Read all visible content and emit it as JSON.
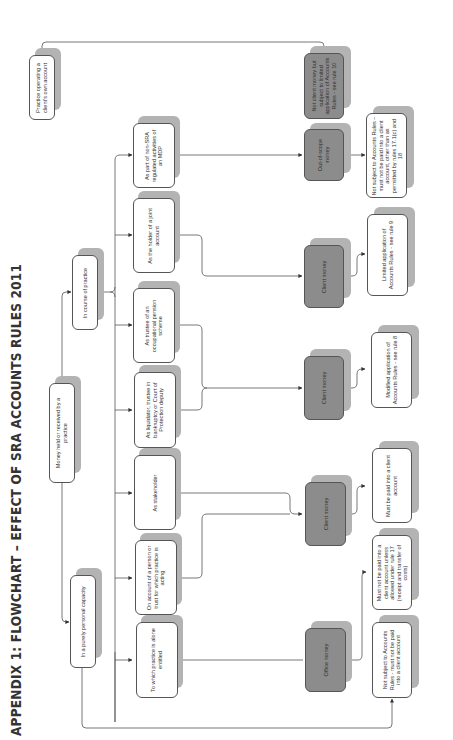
{
  "title": "APPENDIX 1: FLOWCHART – EFFECT OF SRA ACCOUNTS RULES 2011",
  "colors": {
    "box_fill": "#ffffff",
    "money_box_fill": "#8c8c8c",
    "shadow": "#b3b3b3",
    "line": "#555555"
  },
  "nodes": {
    "client_own": {
      "label": "Practice operating a client's own account"
    },
    "root": {
      "label": "Money held or received by a practice"
    },
    "course": {
      "label": "In course of practice"
    },
    "personal": {
      "label": "In a purely personal capacity"
    },
    "mdp": {
      "label": "As part of non-SRA regulated activities of an MDP"
    },
    "joint": {
      "label": "As the holder of a joint account"
    },
    "pension": {
      "label": "As trustee of an occupational pension scheme"
    },
    "liquidator": {
      "label": "As liquidator, trustee in bankruptcy or Court of Protection deputy"
    },
    "stakeholder": {
      "label": "As stakeholder"
    },
    "on_account": {
      "label": "On account of a person or trust for which practice is acting"
    },
    "alone": {
      "label": "To which practice is alone entitled"
    },
    "not_client_money": {
      "label": "Not client money but subject to limited application of Accounts Rules - see rule 10"
    },
    "out_of_scope": {
      "label": "Out-of-scope money"
    },
    "client_money_joint": {
      "label": "Client money"
    },
    "client_money_mod": {
      "label": "Client money"
    },
    "client_money_std": {
      "label": "Client money"
    },
    "office_money": {
      "label": "Office money"
    },
    "res_mdp": {
      "label": "Not subject to Accounts Rules – must not be paid into a client account, other than as permitted by rules 17.1(c) and 18"
    },
    "res_limited": {
      "label": "Limited application of Accounts Rules - see rule 9"
    },
    "res_modified": {
      "label": "Modified application of Accounts Rules - see rule 8"
    },
    "res_client": {
      "label": "Must be paid into a client account"
    },
    "res_office": {
      "label": "Must not be paid into a client account unless allowed under rule 17 (receipt and transfer of costs)"
    },
    "res_personal": {
      "label": "Not subject to Accounts Rules - must not be paid into a client account"
    }
  }
}
